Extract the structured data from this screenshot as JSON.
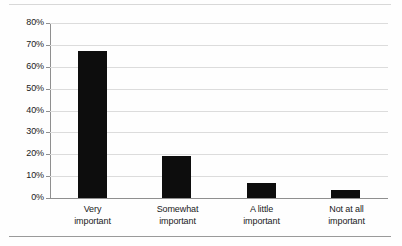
{
  "chart_data": {
    "type": "bar",
    "title": "",
    "subtitle": "",
    "xlabel": "",
    "ylabel": "",
    "categories": [
      "Very important",
      "Somewhat important",
      "A little important",
      "Not at all important"
    ],
    "category_lines": [
      [
        "Very",
        "important"
      ],
      [
        "Somewhat",
        "important"
      ],
      [
        "A little",
        "important"
      ],
      [
        "Not at all",
        "important"
      ]
    ],
    "values": [
      67,
      19,
      7,
      3.5
    ],
    "value_labels": [
      "67%",
      "19%",
      "7%",
      "3.5%"
    ],
    "ylim": [
      0,
      80
    ],
    "ytick_values": [
      0,
      10,
      20,
      30,
      40,
      50,
      60,
      70,
      80
    ],
    "ytick_labels": [
      "0%",
      "10%",
      "20%",
      "30%",
      "40%",
      "50%",
      "60%",
      "70%",
      "80%"
    ],
    "grid": true,
    "legend": false,
    "legend_position": "none",
    "bar_color": "#0d0d0d",
    "gridline_color": "#dcdcdc",
    "axis_color": "#8f8f8f",
    "background_color": "#fefefe"
  }
}
